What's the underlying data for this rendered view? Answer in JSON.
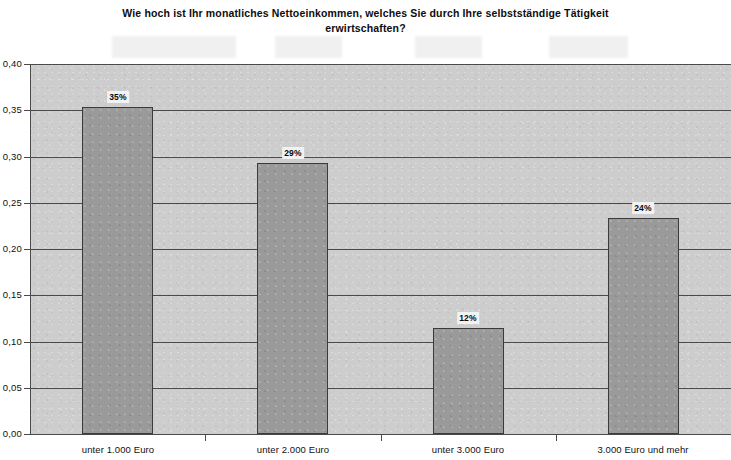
{
  "chart_data": {
    "type": "bar",
    "title": "Wie hoch ist Ihr monatliches Nettoeinkommen, welches Sie durch Ihre selbstständige Tätigkeit\nerwirtschaften?",
    "xlabel": "",
    "ylabel": "",
    "categories": [
      "unter 1.000 Euro",
      "unter 2.000 Euro",
      "unter 3.000 Euro",
      "3.000 Euro und mehr"
    ],
    "values": [
      0.353,
      0.293,
      0.115,
      0.233
    ],
    "data_labels": [
      "35%",
      "29%",
      "12%",
      "24%"
    ],
    "ylim": [
      0.0,
      0.4
    ],
    "ytick_labels": [
      "0,40",
      "0,35",
      "0,30",
      "0,25",
      "0,20",
      "0,15",
      "0,10",
      "0,05",
      "0,00"
    ],
    "ytick_values": [
      0.4,
      0.35,
      0.3,
      0.25,
      0.2,
      0.15,
      0.1,
      0.05,
      0.0
    ],
    "grid": true,
    "legend": false,
    "legend_position": "none",
    "colors": {
      "bar_fill": "#9a9a9a",
      "bar_border": "#3b3b3b",
      "plot_background": "#cdcdcd",
      "gridline": "#4a4a4a",
      "text": "#101010",
      "page_background": "#ffffff"
    }
  }
}
